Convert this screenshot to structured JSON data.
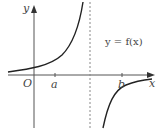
{
  "diagram": {
    "equation_label": "y = f(x)",
    "axes": {
      "x_label": "x",
      "y_label": "y",
      "origin_label": "O"
    },
    "x_marks": [
      {
        "label": "a"
      },
      {
        "label": "b"
      }
    ],
    "asymptote": {
      "style": "dashed",
      "orientation": "vertical",
      "position": "between a and b"
    },
    "curve": {
      "branches": [
        {
          "name": "left-branch",
          "behaviour": "increasing from near x-axis, rising to +infinity at asymptote"
        },
        {
          "name": "right-branch",
          "behaviour": "rising from -infinity at asymptote, crossing x-axis at b, approaching horizontal level"
        }
      ]
    },
    "colors": {
      "axis": "#555555",
      "curve": "#222222",
      "asymptote": "#888888",
      "text": "#444444"
    }
  }
}
